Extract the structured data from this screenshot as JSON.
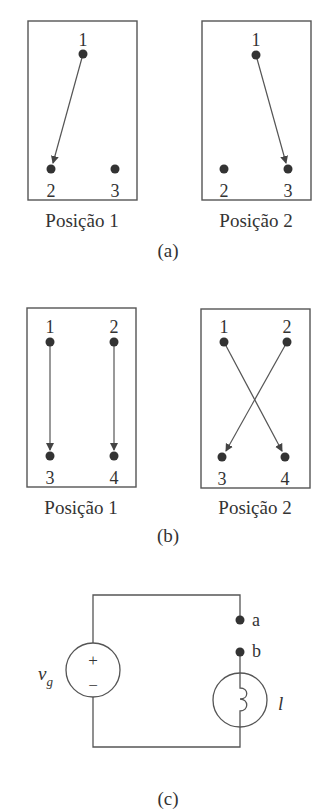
{
  "figure_a": {
    "caption": "(a)",
    "positions": [
      {
        "label": "Posição 1",
        "terminals": [
          "1",
          "2",
          "3"
        ],
        "connection": "1 → 2"
      },
      {
        "label": "Posição 2",
        "terminals": [
          "1",
          "2",
          "3"
        ],
        "connection": "1 → 3"
      }
    ]
  },
  "figure_b": {
    "caption": "(b)",
    "positions": [
      {
        "label": "Posição 1",
        "terminals": [
          "1",
          "2",
          "3",
          "4"
        ],
        "connections": [
          "1 → 3",
          "2 → 4"
        ]
      },
      {
        "label": "Posição 2",
        "terminals": [
          "1",
          "2",
          "3",
          "4"
        ],
        "connections": [
          "1 → 4",
          "2 → 3"
        ]
      }
    ]
  },
  "figure_c": {
    "caption": "(c)",
    "source_label": "v",
    "source_subscript": "g",
    "source_plus": "+",
    "source_minus": "−",
    "terminal_a": "a",
    "terminal_b": "b",
    "lamp_label": "l"
  },
  "colors": {
    "line": "#555555",
    "text": "#333333",
    "background": "#ffffff"
  }
}
